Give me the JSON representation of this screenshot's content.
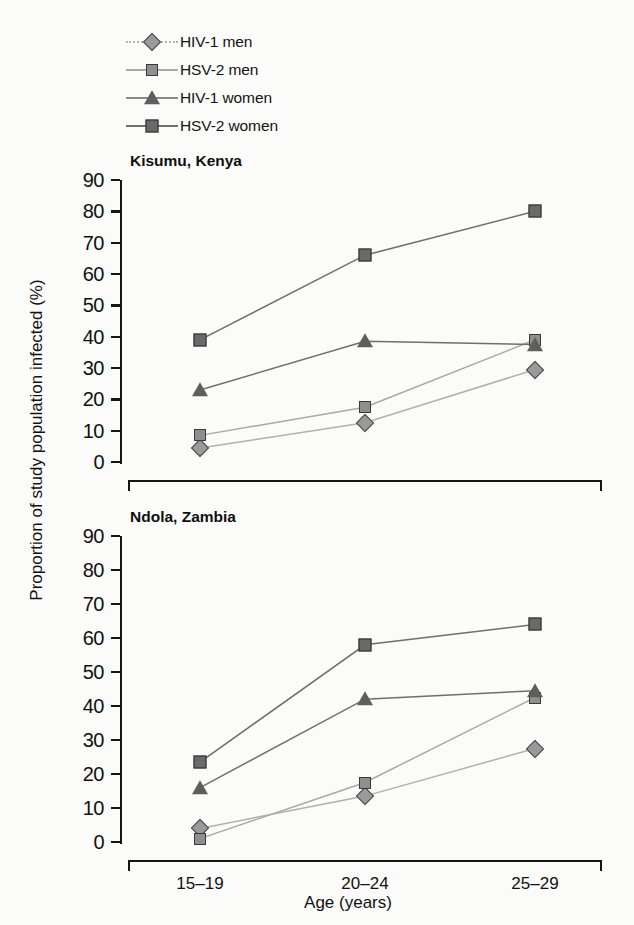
{
  "chart_data": {
    "type": "line",
    "title": "",
    "xlabel": "Age (years)",
    "ylabel": "Proportion of study population infected (%)",
    "categories": [
      "15–19",
      "20–24",
      "25–29"
    ],
    "ylim": [
      0,
      90
    ],
    "yticks": [
      0,
      10,
      20,
      30,
      40,
      50,
      60,
      70,
      80,
      90
    ],
    "grid": false,
    "legend_position": "top-left",
    "legend": [
      "HIV-1 men",
      "HSV-2 men",
      "HIV-1 women",
      "HSV-2 women"
    ],
    "panels": [
      {
        "title": "Kisumu, Kenya",
        "series": [
          {
            "name": "HIV-1 men",
            "marker": "diamond",
            "color": "#9a9a9a",
            "line_color": "#b0b0b0",
            "values": [
              4.5,
              12.5,
              29.5
            ]
          },
          {
            "name": "HSV-2 men",
            "marker": "square-small",
            "color": "#8f8f8f",
            "line_color": "#a8a8a8",
            "values": [
              8.5,
              17.5,
              39.0
            ]
          },
          {
            "name": "HIV-1 women",
            "marker": "triangle",
            "color": "#5e5e5e",
            "line_color": "#6f6f6f",
            "values": [
              23.0,
              38.5,
              37.5
            ]
          },
          {
            "name": "HSV-2 women",
            "marker": "square",
            "color": "#6a6a6a",
            "line_color": "#6f6f6f",
            "values": [
              39.0,
              66.0,
              80.0
            ]
          }
        ]
      },
      {
        "title": "Ndola, Zambia",
        "series": [
          {
            "name": "HIV-1 men",
            "marker": "diamond",
            "color": "#9a9a9a",
            "line_color": "#b0b0b0",
            "values": [
              4.0,
              13.5,
              27.5
            ]
          },
          {
            "name": "HSV-2 men",
            "marker": "square-small",
            "color": "#8f8f8f",
            "line_color": "#a8a8a8",
            "values": [
              1.0,
              17.5,
              42.5
            ]
          },
          {
            "name": "HIV-1 women",
            "marker": "triangle",
            "color": "#5e5e5e",
            "line_color": "#6f6f6f",
            "values": [
              16.0,
              42.0,
              44.5
            ]
          },
          {
            "name": "HSV-2 women",
            "marker": "square",
            "color": "#6a6a6a",
            "line_color": "#6f6f6f",
            "values": [
              23.5,
              58.0,
              64.0
            ]
          }
        ]
      }
    ]
  },
  "legend": {
    "items": [
      {
        "label": "HIV-1 men",
        "marker": "diamond",
        "color": "#9a9a9a",
        "line_color": "#b4b4b4",
        "line_style": "dotted"
      },
      {
        "label": "HSV-2 men",
        "marker": "square-small",
        "color": "#8f8f8f",
        "line_color": "#ababab",
        "line_style": "solid"
      },
      {
        "label": "HIV-1 women",
        "marker": "triangle",
        "color": "#5e5e5e",
        "line_color": "#8a8a8a",
        "line_style": "solid"
      },
      {
        "label": "HSV-2 women",
        "marker": "square",
        "color": "#6a6a6a",
        "line_color": "#707070",
        "line_style": "solid"
      }
    ]
  },
  "panel_titles": {
    "kisumu": "Kisumu, Kenya",
    "ndola": "Ndola, Zambia"
  },
  "axes": {
    "y_label": "Proportion of study population infected (%)",
    "x_label": "Age (years)",
    "y_ticks": [
      "0",
      "10",
      "20",
      "30",
      "40",
      "50",
      "60",
      "70",
      "80",
      "90"
    ],
    "x_ticks": [
      "15–19",
      "20–24",
      "25–29"
    ]
  }
}
